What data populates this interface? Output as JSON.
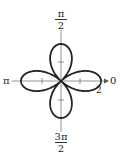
{
  "chart_data": {
    "type": "polar-rose",
    "equation": "r = 2cos(2θ)",
    "petals": 4,
    "max_r": 2,
    "axis_labels": {
      "top_num": "π",
      "top_den": "2",
      "left": "π",
      "right": "0",
      "bottom_num": "3π",
      "bottom_den": "2",
      "radius_tick": "2"
    }
  }
}
